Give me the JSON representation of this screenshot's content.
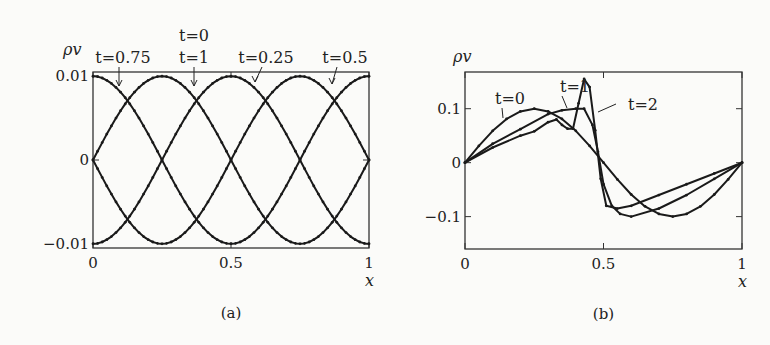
{
  "chart_data": [
    {
      "panel": "a",
      "type": "line",
      "caption": "(a)",
      "xlabel": "x",
      "ylabel": "ρv",
      "xlim": [
        0,
        1
      ],
      "ylim": [
        -0.0105,
        0.0105
      ],
      "xticks": [
        {
          "v": 0,
          "label": "0"
        },
        {
          "v": 0.5,
          "label": "0.5"
        },
        {
          "v": 1,
          "label": "1"
        }
      ],
      "yticks": [
        {
          "v": 0.01,
          "label": "0.01"
        },
        {
          "v": 0,
          "label": "0"
        },
        {
          "v": -0.01,
          "label": "−0.01"
        }
      ],
      "grid": false,
      "series_formula": "rho_v = 0.01*sin(2*pi*(x + phase))",
      "series": [
        {
          "name": "t=0 / t=1",
          "phase": 0.25
        },
        {
          "name": "t=0.25",
          "phase": 0.0
        },
        {
          "name": "t=0.5",
          "phase": 0.75
        },
        {
          "name": "t=0.75",
          "phase": 0.5
        }
      ],
      "annotations": [
        {
          "text": "t=0.75",
          "x": 0.11,
          "y": 0.01
        },
        {
          "text": "t=0",
          "x": 0.37,
          "y": 0.01,
          "line2": "t=1"
        },
        {
          "text": "t=0.25",
          "x": 0.62,
          "y": 0.01
        },
        {
          "text": "t=0.5",
          "x": 0.87,
          "y": 0.01
        }
      ]
    },
    {
      "panel": "b",
      "type": "line",
      "caption": "(b)",
      "xlabel": "x",
      "ylabel": "ρv",
      "xlim": [
        0,
        1
      ],
      "ylim": [
        -0.16,
        0.168
      ],
      "xticks": [
        {
          "v": 0,
          "label": "0"
        },
        {
          "v": 0.5,
          "label": "0.5"
        },
        {
          "v": 1,
          "label": "1"
        }
      ],
      "yticks": [
        {
          "v": 0.1,
          "label": "0.1"
        },
        {
          "v": 0,
          "label": "0"
        },
        {
          "v": -0.1,
          "label": "−0.1"
        }
      ],
      "grid": false,
      "series": [
        {
          "name": "t=0",
          "x": [
            0,
            0.05,
            0.1,
            0.15,
            0.2,
            0.25,
            0.3,
            0.35,
            0.4,
            0.45,
            0.5,
            0.55,
            0.6,
            0.65,
            0.7,
            0.75,
            0.8,
            0.85,
            0.9,
            0.95,
            1
          ],
          "y": [
            0,
            0.031,
            0.059,
            0.081,
            0.095,
            0.1,
            0.095,
            0.081,
            0.059,
            0.031,
            0,
            -0.031,
            -0.059,
            -0.081,
            -0.095,
            -0.1,
            -0.095,
            -0.081,
            -0.059,
            -0.031,
            0
          ]
        },
        {
          "name": "t=1",
          "x": [
            0,
            0.1,
            0.2,
            0.3,
            0.35,
            0.4,
            0.43,
            0.46,
            0.48,
            0.5,
            0.53,
            0.56,
            0.6,
            0.7,
            0.8,
            0.9,
            1
          ],
          "y": [
            0,
            0.035,
            0.062,
            0.09,
            0.097,
            0.1,
            0.1,
            0.07,
            0.02,
            -0.04,
            -0.08,
            -0.095,
            -0.1,
            -0.085,
            -0.06,
            -0.03,
            0
          ]
        },
        {
          "name": "t=2",
          "x": [
            0,
            0.1,
            0.2,
            0.25,
            0.3,
            0.33,
            0.35,
            0.37,
            0.39,
            0.41,
            0.43,
            0.45,
            0.47,
            0.49,
            0.51,
            0.55,
            0.6,
            0.7,
            0.8,
            0.9,
            1
          ],
          "y": [
            0,
            0.028,
            0.05,
            0.058,
            0.075,
            0.08,
            0.07,
            0.063,
            0.063,
            0.11,
            0.155,
            0.14,
            0.06,
            -0.03,
            -0.08,
            -0.085,
            -0.08,
            -0.06,
            -0.04,
            -0.02,
            0
          ]
        }
      ],
      "annotations": [
        {
          "text": "t=0",
          "x": 0.05,
          "y": 0.14
        },
        {
          "text": "t=1",
          "x": 0.25,
          "y": 0.155
        },
        {
          "text": "t=2",
          "x": 0.65,
          "y": 0.11
        }
      ]
    }
  ]
}
